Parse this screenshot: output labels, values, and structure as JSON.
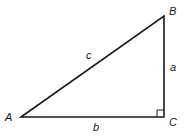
{
  "diagram": {
    "type": "right-triangle",
    "vertices": {
      "A": {
        "label": "A",
        "x": 21,
        "y": 117
      },
      "B": {
        "label": "B",
        "x": 164,
        "y": 16
      },
      "C": {
        "label": "C",
        "x": 164,
        "y": 117
      }
    },
    "sides": {
      "a": {
        "label": "a",
        "between": [
          "B",
          "C"
        ]
      },
      "b": {
        "label": "b",
        "between": [
          "A",
          "C"
        ]
      },
      "c": {
        "label": "c",
        "between": [
          "A",
          "B"
        ]
      }
    },
    "right_angle_at": "C",
    "stroke_color": "#1a1a1a",
    "background": "#ffffff"
  }
}
